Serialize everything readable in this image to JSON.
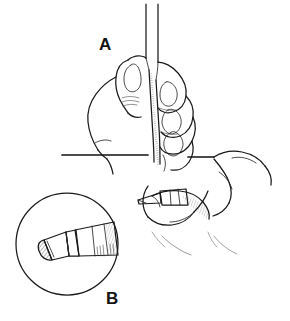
{
  "figure": {
    "kind": "line-art-medical-illustration",
    "style": "pen-and-ink hatched line drawing",
    "background_color": "#ffffff",
    "ink_color": "#1a1a1a",
    "width": 290,
    "height": 321,
    "panels": [
      {
        "id": "A",
        "label": "A",
        "label_x": 99,
        "label_y": 36,
        "description": "Hand gripping a vertical syringe barrel, inserting the needle into tissue stabilized by a second hand"
      },
      {
        "id": "B",
        "label": "B",
        "label_x": 106,
        "label_y": 290,
        "description": "Circular magnified inset showing the beveled needle tip and hub in detail"
      }
    ],
    "elements": {
      "syringe_barrel": "two parallel vertical lines running off the top edge of the frame",
      "upper_hand": "thumb and three curled fingers with fingernails gripping the barrel",
      "lower_hand": "fingers entering from the right, pinching the tissue fold",
      "horizontal_rule": "straight horizontal line across the mid-frame, arm or table edge",
      "needle_tip": "short beveled cannula shown entering the tissue fold",
      "inset_circle": "magnification bubble outlined as a plain circle",
      "inset_needle": "beveled needle point with cross-hatched bevel face attached to a tapered hub"
    },
    "shading": {
      "technique": "stipple and parallel hatching",
      "hatched_regions": [
        "needle bevel face",
        "syringe shadow edge",
        "hub taper",
        "tissue fold"
      ]
    }
  }
}
